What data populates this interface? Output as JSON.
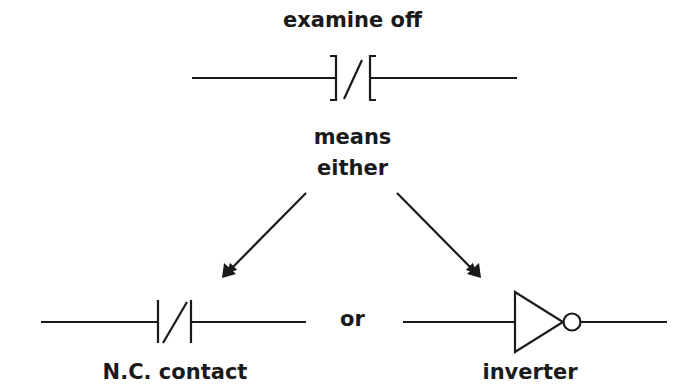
{
  "diagram": {
    "title": "examine off",
    "middle_label_line1": "means",
    "middle_label_line2": "either",
    "connector_word": "or",
    "left_option_label": "N.C. contact",
    "right_option_label": "inverter",
    "symbols": {
      "top": "examine-off-contact",
      "left": "normally-closed-contact",
      "right": "inverter-gate"
    },
    "colors": {
      "stroke": "#1a1a1a",
      "background": "#ffffff"
    }
  }
}
